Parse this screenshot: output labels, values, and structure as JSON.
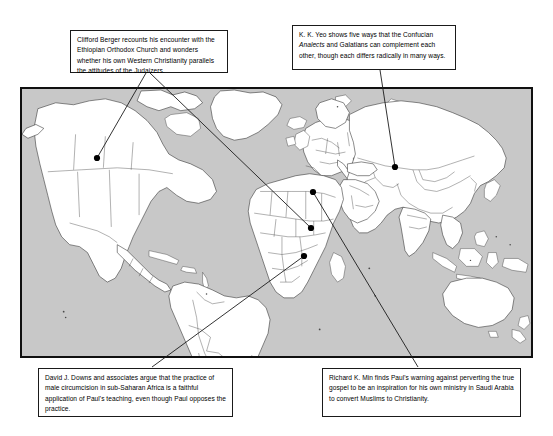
{
  "figure": {
    "type": "annotated-world-map",
    "map": {
      "name": "world-map",
      "ocean_color": "#c8c8c8",
      "land_color": "#ffffff",
      "border_color": "#2b2b2b",
      "frame_color": "#101010"
    },
    "markers": [
      {
        "id": "marker-united-states",
        "label": "United States",
        "x": 97,
        "y": 158
      },
      {
        "id": "marker-china",
        "label": "China",
        "x": 395,
        "y": 167
      },
      {
        "id": "marker-saudi-arabia",
        "label": "Saudi Arabia",
        "x": 313,
        "y": 192
      },
      {
        "id": "marker-ethiopia",
        "label": "Ethiopia",
        "x": 311,
        "y": 228
      },
      {
        "id": "marker-sub-saharan-africa",
        "label": "Sub-Saharan Africa",
        "x": 304,
        "y": 256
      }
    ],
    "callouts": [
      {
        "id": "callout-berger",
        "name": "callout-berger",
        "text_parts": [
          {
            "text": "Clifford Berger recounts his encounter with the Ethiopian Orthodox Church and wonders whether his own Western Christianity parallels the attitudes of the Judaizers.",
            "style": "normal"
          }
        ],
        "text": "Clifford Berger recounts his encounter with the Ethiopian Orthodox Church and wonders whether his own Western Christianity parallels the attitudes of the Judaizers.",
        "connects_to": [
          "marker-united-states",
          "marker-ethiopia"
        ]
      },
      {
        "id": "callout-yeo",
        "name": "callout-yeo",
        "text_parts": [
          {
            "text": "K. K. Yeo shows five ways that the Confucian ",
            "style": "normal"
          },
          {
            "text": "Analects",
            "style": "italic"
          },
          {
            "text": " and Galatians can complement each other, though each differs radically in many ways.",
            "style": "normal"
          }
        ],
        "text": "K. K. Yeo shows five ways that the Confucian Analects and Galatians can complement each other, though each differs radically in many ways.",
        "connects_to": [
          "marker-china"
        ]
      },
      {
        "id": "callout-downs",
        "name": "callout-downs",
        "text_parts": [
          {
            "text": "David J. Downs and associates argue that the practice of male circumcision in sub-Saharan Africa is a faithful application of Paul's teaching, even though Paul opposes the practice.",
            "style": "normal"
          }
        ],
        "text": "David J. Downs and associates argue that the practice of male circumcision in sub-Saharan Africa is a faithful application of Paul's teaching, even though Paul opposes the practice.",
        "connects_to": [
          "marker-sub-saharan-africa"
        ]
      },
      {
        "id": "callout-min",
        "name": "callout-min",
        "text_parts": [
          {
            "text": "Richard K. Min finds Paul's warning against perverting the true gospel to be an inspiration for his own ministry in Saudi Arabia to convert Muslims to Christianity.",
            "style": "normal"
          }
        ],
        "text": "Richard K. Min finds Paul's warning against perverting the true gospel to be an inspiration for his own ministry in Saudi Arabia to convert Muslims to Christianity.",
        "connects_to": [
          "marker-saudi-arabia"
        ]
      }
    ],
    "leader_lines": [
      {
        "from": "callout-berger",
        "x1": 146,
        "y1": 73,
        "x2": 97,
        "y2": 158
      },
      {
        "from": "callout-berger",
        "x1": 150,
        "y1": 73,
        "x2": 311,
        "y2": 228
      },
      {
        "from": "callout-yeo",
        "x1": 380,
        "y1": 70,
        "x2": 395,
        "y2": 167
      },
      {
        "from": "callout-downs",
        "x1": 152,
        "y1": 367,
        "x2": 304,
        "y2": 256
      },
      {
        "from": "callout-min",
        "x1": 418,
        "y1": 367,
        "x2": 313,
        "y2": 192
      }
    ]
  }
}
